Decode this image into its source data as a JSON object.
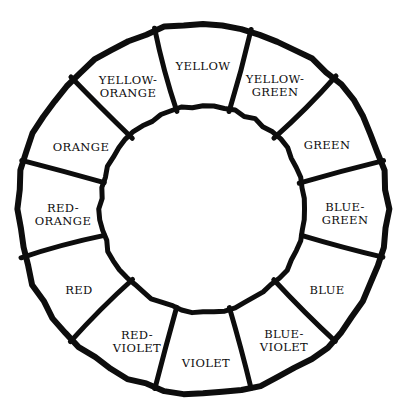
{
  "figure": {
    "name": "color-wheel",
    "background_color": "#ffffff",
    "ink_color": "#0d0d0d",
    "style": "hand-drawn ink line art, unfilled annulus"
  },
  "chart_data": {
    "type": "pie",
    "title": "",
    "subtitle": "",
    "xlabel": "",
    "ylabel": "",
    "legend_position": "none",
    "grid": false,
    "shape": "annulus",
    "segment_count": 12,
    "segment_degrees": 30,
    "start_angle_deg": -15,
    "direction": "clockwise",
    "geometry": {
      "center_x": 203,
      "center_y": 209,
      "outer_radius": 185,
      "inner_radius": 103,
      "label_radius": 143,
      "stroke_width_outer": 6,
      "stroke_width_inner": 5,
      "stroke_width_spoke": 5
    },
    "categories": [
      "YELLOW",
      "YELLOW-GREEN",
      "GREEN",
      "BLUE-GREEN",
      "BLUE",
      "BLUE-VIOLET",
      "VIOLET",
      "RED-VIOLET",
      "RED",
      "RED-ORANGE",
      "ORANGE",
      "YELLOW-ORANGE"
    ],
    "values": [
      30,
      30,
      30,
      30,
      30,
      30,
      30,
      30,
      30,
      30,
      30,
      30
    ],
    "segments": [
      {
        "index": 0,
        "label": "YELLOW",
        "label_lines": [
          "YELLOW"
        ],
        "center_angle_deg": 0,
        "start_angle_deg": -15,
        "end_angle_deg": 15,
        "label_x": 203,
        "label_y": 66
      },
      {
        "index": 1,
        "label": "YELLOW-GREEN",
        "label_lines": [
          "YELLOW-",
          "GREEN"
        ],
        "center_angle_deg": 30,
        "start_angle_deg": 15,
        "end_angle_deg": 45,
        "label_x": 275,
        "label_y": 85
      },
      {
        "index": 2,
        "label": "GREEN",
        "label_lines": [
          "GREEN"
        ],
        "center_angle_deg": 60,
        "start_angle_deg": 45,
        "end_angle_deg": 75,
        "label_x": 327,
        "label_y": 145
      },
      {
        "index": 3,
        "label": "BLUE-GREEN",
        "label_lines": [
          "BLUE-",
          "GREEN"
        ],
        "center_angle_deg": 90,
        "start_angle_deg": 75,
        "end_angle_deg": 105,
        "label_x": 345,
        "label_y": 213
      },
      {
        "index": 4,
        "label": "BLUE",
        "label_lines": [
          "BLUE"
        ],
        "center_angle_deg": 120,
        "start_angle_deg": 105,
        "end_angle_deg": 135,
        "label_x": 327,
        "label_y": 290
      },
      {
        "index": 5,
        "label": "BLUE-VIOLET",
        "label_lines": [
          "BLUE-",
          "VIOLET"
        ],
        "center_angle_deg": 150,
        "start_angle_deg": 135,
        "end_angle_deg": 165,
        "label_x": 284,
        "label_y": 340
      },
      {
        "index": 6,
        "label": "VIOLET",
        "label_lines": [
          "VIOLET"
        ],
        "center_angle_deg": 180,
        "start_angle_deg": 165,
        "end_angle_deg": 195,
        "label_x": 206,
        "label_y": 363
      },
      {
        "index": 7,
        "label": "RED-VIOLET",
        "label_lines": [
          "RED-",
          "VIOLET"
        ],
        "center_angle_deg": 210,
        "start_angle_deg": 195,
        "end_angle_deg": 225,
        "label_x": 137,
        "label_y": 341
      },
      {
        "index": 8,
        "label": "RED",
        "label_lines": [
          "RED"
        ],
        "center_angle_deg": 240,
        "start_angle_deg": 225,
        "end_angle_deg": 255,
        "label_x": 79,
        "label_y": 290
      },
      {
        "index": 9,
        "label": "RED-ORANGE",
        "label_lines": [
          "RED-",
          "ORANGE"
        ],
        "center_angle_deg": 270,
        "start_angle_deg": 255,
        "end_angle_deg": 285,
        "label_x": 63,
        "label_y": 214
      },
      {
        "index": 10,
        "label": "ORANGE",
        "label_lines": [
          "ORANGE"
        ],
        "center_angle_deg": 300,
        "start_angle_deg": 285,
        "end_angle_deg": 315,
        "label_x": 81,
        "label_y": 147
      },
      {
        "index": 11,
        "label": "YELLOW-ORANGE",
        "label_lines": [
          "YELLOW-",
          "ORANGE"
        ],
        "center_angle_deg": 330,
        "start_angle_deg": 315,
        "end_angle_deg": 345,
        "label_x": 128,
        "label_y": 86
      }
    ]
  }
}
